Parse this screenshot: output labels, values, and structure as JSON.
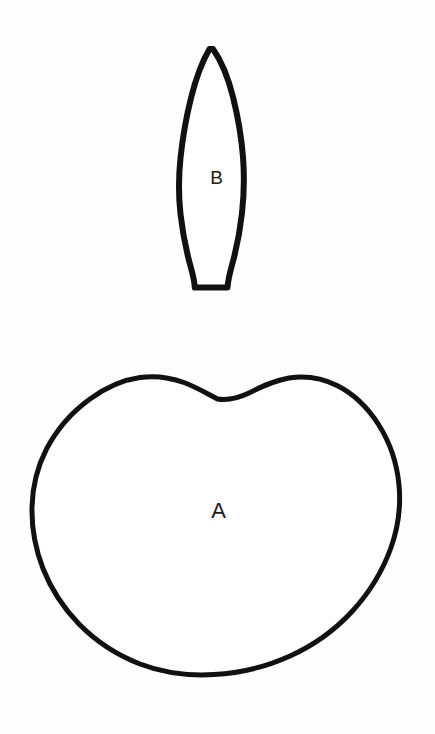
{
  "document": {
    "kind": "line-drawing",
    "background_color": "#fefefe",
    "ink_color": "#111111",
    "width": 435,
    "height": 734
  },
  "figure": {
    "title": "",
    "caption": "",
    "shapes": [
      {
        "id": "shape-b",
        "label": "B",
        "description": "narrow elongated lancet / leaf-blade outline with pointed apex and flat truncated base",
        "stroke_color": "#111111",
        "fill_color": "#ffffff",
        "stroke_width": 6,
        "bounds": {
          "x": 176,
          "y": 48,
          "width": 70,
          "height": 242
        },
        "label_position": {
          "x": 210,
          "y": 185
        },
        "path": "M 209.5 49 C 203 60 196 78 191 98 C 186 118 182.5 139 180.5 158 C 178.5 177 178.5 196 180.5 214 C 182.5 232 186.5 252 191 268 C 193.5 277 194.5 282 194.8 287.5 L 227.5 287.5 C 228 281 229.5 274 232 265 C 236.5 249 240 231 242 213 C 244 195 244.5 176 243 157 C 241.5 138 238 117 233 97 C 228 77 220 59 213 49 Z"
      },
      {
        "id": "shape-a",
        "label": "A",
        "description": "large rounded kidney / bean outline with a shallow concave notch in the top centre",
        "stroke_color": "#111111",
        "fill_color": "#ffffff",
        "stroke_width": 5,
        "bounds": {
          "x": 32,
          "y": 375,
          "width": 368,
          "height": 300
        },
        "label_position": {
          "x": 218,
          "y": 519
        },
        "path": "M 217.5 399 C 206 393 196 387 184 382.5 C 170 377.5 155 375.5 140 377.5 C 122 380 105 388 90 399 C 72 412 57 429 46.5 449 C 37 467.5 32.5 487 32 507 C 31.5 528 35.5 549 43 568.5 C 51 589 63.5 608 79 624 C 96 641.5 117 655 140 664 C 163.5 673 189 676 214 674.5 C 240 673 266 667 290 656 C 313.5 645.5 335 630 352.5 611 C 369 593 382 572 390.5 549 C 398 528.5 401 506.5 399 485 C 397 463.5 390 442.5 378.5 424.5 C 368 408 354 394 337 385.5 C 322 378 305 375.5 289 378 C 274 380.5 261 387 249 393 C 239.5 397.5 230 401 217.5 399 Z"
      }
    ]
  }
}
